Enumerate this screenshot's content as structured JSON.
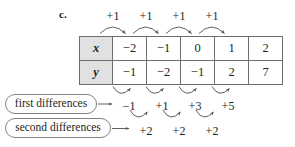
{
  "figure": {
    "part_label": "c.",
    "table": {
      "rows": [
        {
          "header": "x",
          "cells": [
            "−2",
            "−1",
            "0",
            "1",
            "2"
          ]
        },
        {
          "header": "y",
          "cells": [
            "−1",
            "−2",
            "−1",
            "2",
            "7"
          ]
        }
      ]
    },
    "x_steps": {
      "label": "x-step",
      "values": [
        "+1",
        "+1",
        "+1",
        "+1"
      ]
    },
    "first_differences": {
      "callout_label": "first differences",
      "values": [
        "−1",
        "+1",
        "+3",
        "+5"
      ]
    },
    "second_differences": {
      "callout_label": "second differences",
      "values": [
        "+2",
        "+2",
        "+2"
      ]
    },
    "colors": {
      "ink": "#231f20",
      "rule": "#6d6e71",
      "header_fill": "#e2e1e1",
      "callout_stroke": "#808285",
      "arrow": "#4d4d4f"
    }
  }
}
